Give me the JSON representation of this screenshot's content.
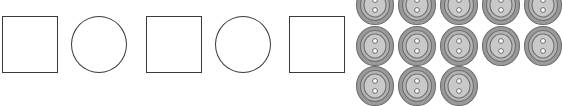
{
  "scene": {
    "title": "Shape pattern and button count worksheet graphic",
    "background_color": "#ffffff"
  },
  "shape_pattern": {
    "name": "alternating-square-circle-pattern",
    "outline_color": "#3a3a3a",
    "fill_color": "#ffffff",
    "count": 5,
    "sequence_label": "square, circle, square, circle, square",
    "items": [
      {
        "index": 1,
        "shape": "square",
        "label": "square"
      },
      {
        "index": 2,
        "shape": "circle",
        "label": "circle"
      },
      {
        "index": 3,
        "shape": "square",
        "label": "square"
      },
      {
        "index": 4,
        "shape": "circle",
        "label": "circle"
      },
      {
        "index": 5,
        "shape": "square",
        "label": "square"
      }
    ]
  },
  "button_cluster": {
    "name": "sewing-button-group",
    "icon": "two-hole-button-icon",
    "total_visible": 13,
    "holes_per_button": 2,
    "colors": {
      "rim_outer": "#9a9a9a",
      "rim_stroke": "#6e6e6e",
      "rim_inner": "#b4b4b4",
      "face": "#c9c9c9",
      "hole_fill": "#ffffff",
      "hole_stroke": "#6e6e6e"
    },
    "rows": [
      {
        "row": 1,
        "count": 5,
        "clipped_top": true,
        "clipped_right": true
      },
      {
        "row": 2,
        "count": 5,
        "clipped_top": false,
        "clipped_right": true
      },
      {
        "row": 3,
        "count": 3,
        "clipped_top": false,
        "clipped_right": false
      }
    ],
    "positions": [
      {
        "id": "btn-r1c1",
        "x": 5,
        "y": -15
      },
      {
        "id": "btn-r1c2",
        "x": 47,
        "y": -15
      },
      {
        "id": "btn-r1c3",
        "x": 89,
        "y": -15
      },
      {
        "id": "btn-r1c4",
        "x": 131,
        "y": -15
      },
      {
        "id": "btn-r1c5",
        "x": 173,
        "y": -15
      },
      {
        "id": "btn-r2c1",
        "x": 5,
        "y": 26
      },
      {
        "id": "btn-r2c2",
        "x": 47,
        "y": 26
      },
      {
        "id": "btn-r2c3",
        "x": 89,
        "y": 26
      },
      {
        "id": "btn-r2c4",
        "x": 131,
        "y": 26
      },
      {
        "id": "btn-r2c5",
        "x": 173,
        "y": 26
      },
      {
        "id": "btn-r3c1",
        "x": 5,
        "y": 66
      },
      {
        "id": "btn-r3c2",
        "x": 47,
        "y": 66
      },
      {
        "id": "btn-r3c3",
        "x": 89,
        "y": 66
      }
    ]
  }
}
